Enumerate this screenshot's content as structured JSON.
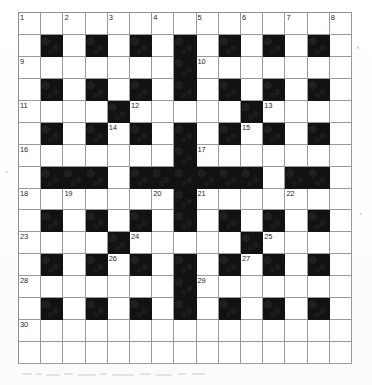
{
  "document": {
    "type": "crossword-puzzle-grid",
    "title": "Crossword Puzzle Grid",
    "media": "scanned-paper"
  },
  "grid": {
    "columns": 15,
    "rows": 16,
    "cell_size_px": 22.3,
    "origin": {
      "x_px": 18,
      "y_px": 12
    },
    "size": {
      "width_px": 334,
      "height_px": 352
    },
    "colors": {
      "block": "#121212",
      "open": "#ffffff",
      "rule": "#9a9a9a",
      "number": "#2a2a2a",
      "paper": "#fefefe"
    },
    "legend": {
      "0": "open (white) cell",
      "1": "blocked (black) cell"
    },
    "blocked_cells_by_row": [
      [],
      [
        2,
        4,
        6,
        8,
        10,
        12,
        14
      ],
      [
        8
      ],
      [
        2,
        4,
        6,
        8,
        10,
        12,
        14
      ],
      [
        5,
        11
      ],
      [
        2,
        4,
        6,
        8,
        10,
        12,
        14
      ],
      [
        8
      ],
      [
        2,
        3,
        4,
        6,
        7,
        8,
        9,
        10,
        11,
        13,
        14
      ],
      [
        8
      ],
      [
        2,
        4,
        6,
        8,
        10,
        12,
        14
      ],
      [
        5,
        11
      ],
      [
        2,
        4,
        6,
        8,
        10,
        12,
        14
      ],
      [
        8
      ],
      [
        2,
        4,
        6,
        8,
        10,
        12,
        14
      ],
      [],
      []
    ],
    "matrix": [
      [
        0,
        0,
        0,
        0,
        0,
        0,
        0,
        0,
        0,
        0,
        0,
        0,
        0,
        0,
        0
      ],
      [
        0,
        1,
        0,
        1,
        0,
        1,
        0,
        1,
        0,
        1,
        0,
        1,
        0,
        1,
        0
      ],
      [
        0,
        0,
        0,
        0,
        0,
        0,
        0,
        1,
        0,
        0,
        0,
        0,
        0,
        0,
        0
      ],
      [
        0,
        1,
        0,
        1,
        0,
        1,
        0,
        1,
        0,
        1,
        0,
        1,
        0,
        1,
        0
      ],
      [
        0,
        0,
        0,
        0,
        1,
        0,
        0,
        0,
        0,
        0,
        1,
        0,
        0,
        0,
        0
      ],
      [
        0,
        1,
        0,
        1,
        0,
        1,
        0,
        1,
        0,
        1,
        0,
        1,
        0,
        1,
        0
      ],
      [
        0,
        0,
        0,
        0,
        0,
        0,
        0,
        1,
        0,
        0,
        0,
        0,
        0,
        0,
        0
      ],
      [
        0,
        1,
        1,
        1,
        0,
        1,
        1,
        1,
        1,
        1,
        1,
        0,
        1,
        1,
        0
      ],
      [
        0,
        0,
        0,
        0,
        0,
        0,
        0,
        1,
        0,
        0,
        0,
        0,
        0,
        0,
        0
      ],
      [
        0,
        1,
        0,
        1,
        0,
        1,
        0,
        1,
        0,
        1,
        0,
        1,
        0,
        1,
        0
      ],
      [
        0,
        0,
        0,
        0,
        1,
        0,
        0,
        0,
        0,
        0,
        1,
        0,
        0,
        0,
        0
      ],
      [
        0,
        1,
        0,
        1,
        0,
        1,
        0,
        1,
        0,
        1,
        0,
        1,
        0,
        1,
        0
      ],
      [
        0,
        0,
        0,
        0,
        0,
        0,
        0,
        1,
        0,
        0,
        0,
        0,
        0,
        0,
        0
      ],
      [
        0,
        1,
        0,
        1,
        0,
        1,
        0,
        1,
        0,
        1,
        0,
        1,
        0,
        1,
        0
      ],
      [
        0,
        0,
        0,
        0,
        0,
        0,
        0,
        0,
        0,
        0,
        0,
        0,
        0,
        0,
        0
      ],
      [
        0,
        0,
        0,
        0,
        0,
        0,
        0,
        0,
        0,
        0,
        0,
        0,
        0,
        0,
        0
      ]
    ],
    "numbers": [
      {
        "n": "1",
        "row": 1,
        "col": 1
      },
      {
        "n": "2",
        "row": 1,
        "col": 3
      },
      {
        "n": "3",
        "row": 1,
        "col": 5
      },
      {
        "n": "4",
        "row": 1,
        "col": 7
      },
      {
        "n": "5",
        "row": 1,
        "col": 9
      },
      {
        "n": "6",
        "row": 1,
        "col": 11
      },
      {
        "n": "7",
        "row": 1,
        "col": 13
      },
      {
        "n": "8",
        "row": 1,
        "col": 15
      },
      {
        "n": "9",
        "row": 3,
        "col": 1
      },
      {
        "n": "10",
        "row": 3,
        "col": 9
      },
      {
        "n": "11",
        "row": 5,
        "col": 1
      },
      {
        "n": "12",
        "row": 5,
        "col": 6
      },
      {
        "n": "13",
        "row": 5,
        "col": 12
      },
      {
        "n": "14",
        "row": 6,
        "col": 5
      },
      {
        "n": "15",
        "row": 6,
        "col": 11
      },
      {
        "n": "16",
        "row": 7,
        "col": 1
      },
      {
        "n": "17",
        "row": 7,
        "col": 9
      },
      {
        "n": "18",
        "row": 9,
        "col": 1
      },
      {
        "n": "19",
        "row": 9,
        "col": 3
      },
      {
        "n": "20",
        "row": 9,
        "col": 7
      },
      {
        "n": "21",
        "row": 9,
        "col": 9
      },
      {
        "n": "22",
        "row": 9,
        "col": 13
      },
      {
        "n": "23",
        "row": 11,
        "col": 1
      },
      {
        "n": "24",
        "row": 11,
        "col": 6
      },
      {
        "n": "25",
        "row": 11,
        "col": 12
      },
      {
        "n": "26",
        "row": 12,
        "col": 5
      },
      {
        "n": "27",
        "row": 12,
        "col": 11
      },
      {
        "n": "28",
        "row": 13,
        "col": 1
      },
      {
        "n": "29",
        "row": 13,
        "col": 9
      },
      {
        "n": "30",
        "row": 15,
        "col": 1
      }
    ]
  }
}
